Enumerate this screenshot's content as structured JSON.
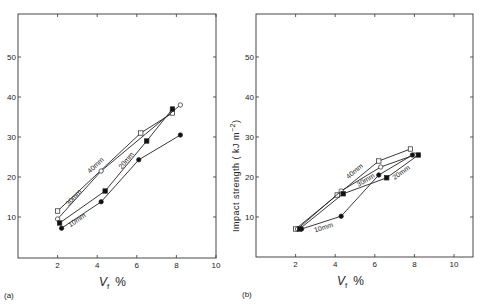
{
  "figure": {
    "ylabel_shared": "Impact  strength  ( kJ m⁻²)",
    "ylabel_main": "Impact  strength  ( kJ m",
    "ylabel_sup": "−2",
    "ylabel_close": ")"
  },
  "chart_data": [
    {
      "type": "line",
      "panel_label": "(a)",
      "xlabel": "V_f %",
      "xlabel_main": "V",
      "xlabel_sub": "f",
      "xlabel_unit": "%",
      "ylabel": "",
      "xlim": [
        0,
        10
      ],
      "ylim": [
        0,
        60
      ],
      "xticks": [
        "2",
        "4",
        "6",
        "8",
        "10"
      ],
      "yticks": [
        "10",
        "20",
        "30",
        "40",
        "50"
      ],
      "grid": false,
      "series": [
        {
          "name": "40mm",
          "marker": "open-square",
          "x": [
            2.0,
            6.2,
            7.8
          ],
          "y": [
            11.5,
            31.0,
            36.0
          ]
        },
        {
          "name": "30mm",
          "marker": "open-circle",
          "x": [
            2.0,
            4.2,
            8.2
          ],
          "y": [
            9.5,
            21.5,
            38.0
          ]
        },
        {
          "name": "20mm",
          "marker": "filled-square",
          "x": [
            2.1,
            4.4,
            6.5,
            7.8
          ],
          "y": [
            8.5,
            16.5,
            29.0,
            37.0
          ]
        },
        {
          "name": "10mm",
          "marker": "filled-circle",
          "x": [
            2.2,
            4.2,
            6.1,
            8.2
          ],
          "y": [
            7.2,
            13.8,
            24.3,
            30.5
          ]
        }
      ]
    },
    {
      "type": "line",
      "panel_label": "(b)",
      "xlabel": "V_f %",
      "xlabel_main": "V",
      "xlabel_sub": "f",
      "xlabel_unit": "%",
      "ylabel": "Impact strength (kJ m⁻²)",
      "xlim": [
        0,
        11
      ],
      "ylim": [
        0,
        60
      ],
      "xticks": [
        "2",
        "4",
        "6",
        "8",
        "10"
      ],
      "yticks": [
        "10",
        "20",
        "30",
        "40",
        "50"
      ],
      "grid": false,
      "series": [
        {
          "name": "40mm",
          "marker": "open-square",
          "x": [
            2.0,
            4.1,
            6.2,
            7.8
          ],
          "y": [
            7.0,
            15.5,
            24.0,
            27.0
          ]
        },
        {
          "name": "30mm",
          "marker": "open-circle",
          "x": [
            2.1,
            4.3,
            6.3,
            8.0
          ],
          "y": [
            7.0,
            16.5,
            22.5,
            25.5
          ]
        },
        {
          "name": "20mm",
          "marker": "filled-square",
          "x": [
            2.2,
            4.4,
            6.6,
            8.2
          ],
          "y": [
            7.0,
            15.8,
            19.8,
            25.5
          ]
        },
        {
          "name": "10mm",
          "marker": "filled-circle",
          "x": [
            2.3,
            4.3,
            6.2,
            7.9
          ],
          "y": [
            7.0,
            10.2,
            20.5,
            25.5
          ]
        }
      ]
    }
  ]
}
